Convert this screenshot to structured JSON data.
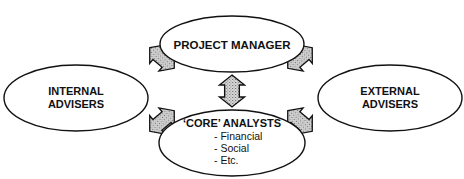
{
  "diagram": {
    "title": "",
    "colors": {
      "background": "#ffffff",
      "stroke": "#111111",
      "arrow_fill": "#c8c8c8",
      "arrow_dot": "#7a7a7a",
      "text": "#111111"
    },
    "nodes": {
      "project_manager": {
        "line1": "PROJECT MANAGER"
      },
      "internal_advisers": {
        "line1": "INTERNAL",
        "line2": "ADVISERS"
      },
      "external_advisers": {
        "line1": "EXTERNAL",
        "line2": "ADVISERS"
      },
      "core_analysts": {
        "line1": "‘CORE’ ANALYSTS",
        "items": [
          "- Financial",
          "- Social",
          "- Etc."
        ]
      }
    },
    "connections": [
      {
        "from": "project_manager",
        "to": "internal_advisers",
        "type": "bidirectional-arrow"
      },
      {
        "from": "project_manager",
        "to": "external_advisers",
        "type": "bidirectional-arrow"
      },
      {
        "from": "project_manager",
        "to": "core_analysts",
        "type": "bidirectional-arrow"
      },
      {
        "from": "internal_advisers",
        "to": "core_analysts",
        "type": "bidirectional-arrow"
      },
      {
        "from": "external_advisers",
        "to": "core_analysts",
        "type": "bidirectional-arrow"
      }
    ]
  }
}
